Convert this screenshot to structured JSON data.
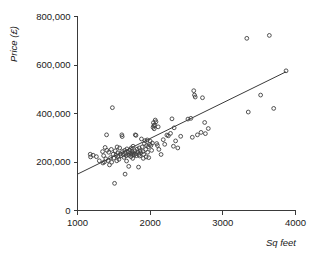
{
  "chart_data": {
    "type": "scatter",
    "title": "",
    "xlabel": "Sq feet",
    "ylabel": "Price (£)",
    "xlim": [
      1000,
      4000
    ],
    "ylim": [
      0,
      800000
    ],
    "xticks": [
      1000,
      2000,
      3000,
      4000
    ],
    "xtick_labels": [
      "1000",
      "2000",
      "3000",
      "4000"
    ],
    "yticks": [
      0,
      200000,
      400000,
      600000,
      800000
    ],
    "ytick_labels": [
      "0",
      "200,000",
      "400,000",
      "600,000",
      "800,000"
    ],
    "grid": false,
    "legend": null,
    "marker": "open-circle",
    "marker_color": "#3f3f3f",
    "series": [
      {
        "name": "Houses",
        "points": [
          [
            1175,
            232000
          ],
          [
            1180,
            221000
          ],
          [
            1215,
            228000
          ],
          [
            1260,
            222000
          ],
          [
            1300,
            205000
          ],
          [
            1345,
            243000
          ],
          [
            1350,
            196000
          ],
          [
            1360,
            226000
          ],
          [
            1370,
            200000
          ],
          [
            1380,
            260000
          ],
          [
            1390,
            213000
          ],
          [
            1400,
            312000
          ],
          [
            1405,
            248000
          ],
          [
            1420,
            206000
          ],
          [
            1430,
            240000
          ],
          [
            1440,
            188000
          ],
          [
            1455,
            218000
          ],
          [
            1465,
            252000
          ],
          [
            1470,
            199000
          ],
          [
            1480,
            424000
          ],
          [
            1490,
            232000
          ],
          [
            1500,
            216000
          ],
          [
            1510,
            112000
          ],
          [
            1520,
            246000
          ],
          [
            1530,
            228000
          ],
          [
            1540,
            205000
          ],
          [
            1545,
            262000
          ],
          [
            1555,
            238000
          ],
          [
            1560,
            222000
          ],
          [
            1570,
            211000
          ],
          [
            1580,
            258000
          ],
          [
            1590,
            234000
          ],
          [
            1600,
            226000
          ],
          [
            1610,
            312000
          ],
          [
            1615,
            305000
          ],
          [
            1620,
            243000
          ],
          [
            1630,
            230000
          ],
          [
            1640,
            219000
          ],
          [
            1650,
            248000
          ],
          [
            1655,
            150000
          ],
          [
            1660,
            236000
          ],
          [
            1670,
            226000
          ],
          [
            1675,
            204000
          ],
          [
            1680,
            254000
          ],
          [
            1690,
            231000
          ],
          [
            1700,
            240000
          ],
          [
            1705,
            182000
          ],
          [
            1710,
            228000
          ],
          [
            1720,
            249000
          ],
          [
            1730,
            236000
          ],
          [
            1735,
            222000
          ],
          [
            1740,
            258000
          ],
          [
            1750,
            243000
          ],
          [
            1755,
            232000
          ],
          [
            1760,
            215000
          ],
          [
            1765,
            265000
          ],
          [
            1770,
            238000
          ],
          [
            1780,
            229000
          ],
          [
            1790,
            246000
          ],
          [
            1795,
            312000
          ],
          [
            1800,
            234000
          ],
          [
            1805,
            310000
          ],
          [
            1810,
            226000
          ],
          [
            1820,
            253000
          ],
          [
            1830,
            241000
          ],
          [
            1840,
            179000
          ],
          [
            1845,
            231000
          ],
          [
            1850,
            258000
          ],
          [
            1855,
            225000
          ],
          [
            1860,
            246000
          ],
          [
            1870,
            238000
          ],
          [
            1880,
            295000
          ],
          [
            1890,
            262000
          ],
          [
            1900,
            243000
          ],
          [
            1905,
            215000
          ],
          [
            1910,
            232000
          ],
          [
            1920,
            276000
          ],
          [
            1930,
            288000
          ],
          [
            1940,
            252000
          ],
          [
            1945,
            221000
          ],
          [
            1950,
            268000
          ],
          [
            1960,
            291000
          ],
          [
            1965,
            240000
          ],
          [
            1975,
            263000
          ],
          [
            1980,
            218000
          ],
          [
            1990,
            272000
          ],
          [
            2000,
            286000
          ],
          [
            2010,
            268000
          ],
          [
            2020,
            248000
          ],
          [
            2030,
            278000
          ],
          [
            2040,
            343000
          ],
          [
            2045,
            362000
          ],
          [
            2050,
            350000
          ],
          [
            2055,
            337000
          ],
          [
            2060,
            352000
          ],
          [
            2070,
            373000
          ],
          [
            2080,
            366000
          ],
          [
            2090,
            276000
          ],
          [
            2100,
            268000
          ],
          [
            2110,
            345000
          ],
          [
            2120,
            252000
          ],
          [
            2150,
            231000
          ],
          [
            2180,
            292000
          ],
          [
            2200,
            273000
          ],
          [
            2230,
            311000
          ],
          [
            2250,
            308000
          ],
          [
            2280,
            318000
          ],
          [
            2300,
            378000
          ],
          [
            2320,
            265000
          ],
          [
            2330,
            341000
          ],
          [
            2350,
            287000
          ],
          [
            2380,
            258000
          ],
          [
            2420,
            306000
          ],
          [
            2520,
            377000
          ],
          [
            2560,
            380000
          ],
          [
            2580,
            302000
          ],
          [
            2600,
            494000
          ],
          [
            2610,
            476000
          ],
          [
            2620,
            468000
          ],
          [
            2650,
            312000
          ],
          [
            2700,
            322000
          ],
          [
            2720,
            465000
          ],
          [
            2750,
            363000
          ],
          [
            2760,
            317000
          ],
          [
            2800,
            338000
          ],
          [
            3330,
            710000
          ],
          [
            3350,
            406000
          ],
          [
            3520,
            476000
          ],
          [
            3640,
            722000
          ],
          [
            3700,
            421000
          ],
          [
            3870,
            576000
          ]
        ]
      }
    ],
    "fit_line": {
      "name": "regression-line",
      "x0": 1000,
      "y0": 150000,
      "x1": 3870,
      "y1": 572000
    }
  }
}
